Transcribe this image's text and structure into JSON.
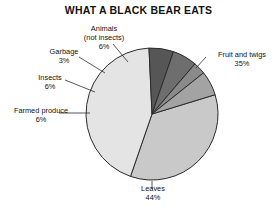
{
  "chart_data": {
    "type": "pie",
    "title": "WHAT A BLACK BEAR EATS",
    "xlabel": "",
    "ylabel": "",
    "legend": "none",
    "grid": false,
    "unit": "%",
    "total": 100,
    "categories": [
      "Fruit and twigs",
      "Leaves",
      "Farmed produce",
      "Insects",
      "Garbage",
      "Animals (not insects)"
    ],
    "values": [
      35,
      44,
      6,
      6,
      3,
      6
    ],
    "slices": [
      {
        "label": "Fruit and twigs",
        "label_line1": "Fruit and twigs",
        "value": 35,
        "percent_text": "35%",
        "color": "#c9c9c9"
      },
      {
        "label": "Leaves",
        "label_line1": "Leaves",
        "value": 44,
        "percent_text": "44%",
        "color": "#e4e4e4"
      },
      {
        "label": "Farmed produce",
        "label_line1": "Farmed produce",
        "value": 6,
        "percent_text": "6%",
        "color": "#565656"
      },
      {
        "label": "Insects",
        "label_line1": "Insects",
        "value": 6,
        "percent_text": "6%",
        "color": "#6e6e6e"
      },
      {
        "label": "Garbage",
        "label_line1": "Garbage",
        "value": 3,
        "percent_text": "3%",
        "color": "#8a8a8a"
      },
      {
        "label": "Animals (not insects)",
        "label_line1": "Animals",
        "label_line2": "(not insects)",
        "value": 6,
        "percent_text": "6%",
        "color": "#a3a3a3"
      }
    ]
  }
}
